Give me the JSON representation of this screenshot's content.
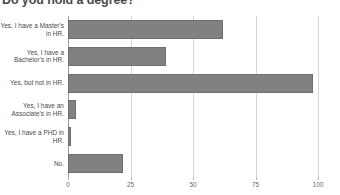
{
  "chart_data": {
    "type": "bar",
    "orientation": "horizontal",
    "title": "Do you hold a degree?",
    "xlabel": "",
    "ylabel": "",
    "xlim": [
      0,
      100
    ],
    "grid": true,
    "legend": "none",
    "bar_color": "#818181",
    "bar_edge_color": "#6f6f6f",
    "gridline_color": "#d8d8d8",
    "axis_color": "#9a9a9a",
    "xticks": [
      0,
      25,
      50,
      75,
      100
    ],
    "xtick_labels": [
      "0",
      "25",
      "50",
      "75",
      "100"
    ],
    "categories": [
      "Yes, I have a Master's in HR.",
      "Yes, I have a Bachelor's in HR.",
      "Yes, but not in HR.",
      "Yes, I have an Associate's in HR.",
      "Yes, I have a PHD in HR.",
      "No."
    ],
    "values": [
      62,
      39,
      98,
      3,
      1,
      22
    ]
  }
}
